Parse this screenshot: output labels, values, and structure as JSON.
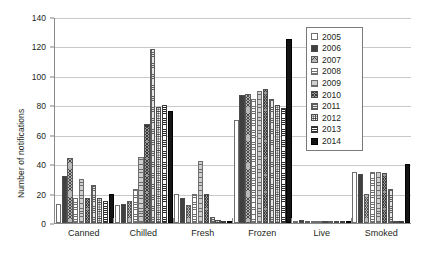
{
  "chart_data": {
    "type": "bar",
    "title": "",
    "xlabel": "",
    "ylabel": "Number of notifications",
    "ylim": [
      0,
      140
    ],
    "yticks": [
      0,
      20,
      40,
      60,
      80,
      100,
      120,
      140
    ],
    "grid": true,
    "legend_position": "top-right",
    "categories": [
      "Canned",
      "Chilled",
      "Fresh",
      "Frozen",
      "Live",
      "Smoked"
    ],
    "series": [
      {
        "name": "2005",
        "pattern": "open-white",
        "values": [
          13,
          12,
          20,
          70,
          1,
          35
        ]
      },
      {
        "name": "2006",
        "pattern": "dark-gray-dotted",
        "values": [
          32,
          13,
          17,
          87,
          2,
          33
        ]
      },
      {
        "name": "2007",
        "pattern": "gray-crosshatch",
        "values": [
          44,
          15,
          12,
          88,
          1,
          20
        ]
      },
      {
        "name": "2008",
        "pattern": "white-horizontal-lines",
        "values": [
          17,
          23,
          20,
          84,
          1,
          35
        ]
      },
      {
        "name": "2009",
        "pattern": "light-gray-horizontal",
        "values": [
          30,
          45,
          42,
          90,
          1,
          35
        ]
      },
      {
        "name": "2010",
        "pattern": "mid-gray-crosshatch",
        "values": [
          17,
          67,
          20,
          91,
          0,
          34
        ]
      },
      {
        "name": "2011",
        "pattern": "light-grid",
        "values": [
          26,
          118,
          4,
          84,
          0,
          23
        ]
      },
      {
        "name": "2012",
        "pattern": "white-dotted",
        "values": [
          17,
          79,
          2,
          80,
          0,
          0
        ]
      },
      {
        "name": "2013",
        "pattern": "white-dense-horizontal",
        "values": [
          15,
          80,
          1,
          78,
          0,
          0
        ]
      },
      {
        "name": "2014",
        "pattern": "solid-black",
        "values": [
          20,
          76,
          1,
          125,
          0,
          40
        ]
      }
    ]
  },
  "legend": {
    "items": [
      {
        "label": "2005"
      },
      {
        "label": "2006"
      },
      {
        "label": "2007"
      },
      {
        "label": "2008"
      },
      {
        "label": "2009"
      },
      {
        "label": "2010"
      },
      {
        "label": "2011"
      },
      {
        "label": "2012"
      },
      {
        "label": "2013"
      },
      {
        "label": "2014"
      }
    ]
  }
}
